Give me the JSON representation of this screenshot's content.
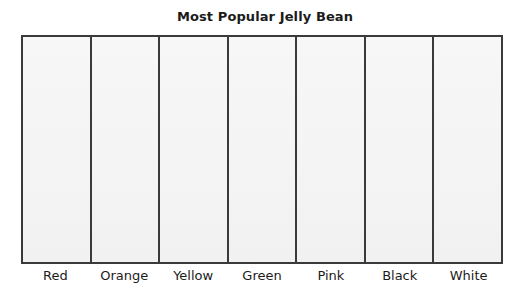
{
  "chart_data": {
    "type": "bar",
    "title": "Most Popular Jelly Bean",
    "subtitle": "",
    "xlabel": "",
    "ylabel": "",
    "categories": [
      "Red",
      "Orange",
      "Yellow",
      "Green",
      "Pink",
      "Black",
      "White"
    ],
    "values": [
      0,
      0,
      0,
      0,
      0,
      0,
      0
    ],
    "ylim": [
      0,
      0
    ],
    "grid": false,
    "legend": false,
    "legend_position": "none",
    "annotations": [],
    "note": "Blank bar-chart template: seven empty category columns, no bars drawn, no y-axis tick labels."
  },
  "chart": {
    "title": "Most Popular Jelly Bean",
    "columns": [
      {
        "label": "Red"
      },
      {
        "label": "Orange"
      },
      {
        "label": "Yellow"
      },
      {
        "label": "Green"
      },
      {
        "label": "Pink"
      },
      {
        "label": "Black"
      },
      {
        "label": "White"
      }
    ],
    "colors": {
      "page_background": "#ffffff",
      "plot_background": "#f4f4f4",
      "frame": "#3a3a3a",
      "divider": "#3a3a3a",
      "text": "#1b1b1b"
    }
  }
}
